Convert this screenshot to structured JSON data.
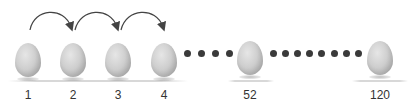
{
  "diagram": {
    "eggs": [
      {
        "label": "1",
        "cx": 28
      },
      {
        "label": "2",
        "cx": 73
      },
      {
        "label": "3",
        "cx": 118
      },
      {
        "label": "4",
        "cx": 164
      },
      {
        "label": "52",
        "cx": 250
      },
      {
        "label": "120",
        "cx": 380
      }
    ],
    "arrows": [
      {
        "from": "1",
        "to": "2"
      },
      {
        "from": "2",
        "to": "3"
      },
      {
        "from": "3",
        "to": "4"
      }
    ],
    "ellipsis_groups": [
      {
        "between": [
          "4",
          "52"
        ],
        "dot_count": 4
      },
      {
        "between": [
          "52",
          "120"
        ],
        "dot_count": 8
      }
    ],
    "colors": {
      "egg": "#c8c8c8",
      "dot": "#3a3a3a",
      "arrow": "#444444",
      "label": "#333333"
    }
  }
}
